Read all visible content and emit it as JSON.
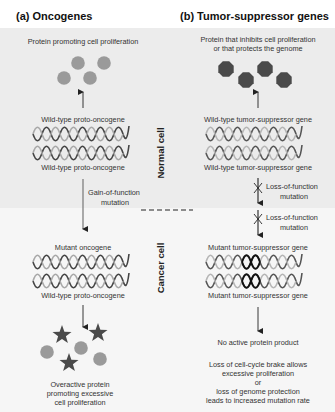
{
  "panel_a": {
    "title": "(a) Oncogenes",
    "protein_label": "Protein promoting cell proliferation",
    "gene_top_label": "Wild-type proto-oncogene",
    "gene_bottom_label": "Wild-type proto-oncogene",
    "mutation_label_1": "Gain-of-function",
    "mutation_label_2": "mutation",
    "mutant_top_label": "Mutant oncogene",
    "mutant_bottom_label": "Wild-type proto-oncogene",
    "result_line_1": "Overactive protein",
    "result_line_2": "promoting excessive",
    "result_line_3": "cell proliferation"
  },
  "panel_b": {
    "title": "(b) Tumor-suppressor genes",
    "protein_label_1": "Protein that inhibits cell proliferation",
    "protein_label_2": "or that protects the genome",
    "gene_top_label": "Wild-type tumor-suppressor gene",
    "gene_bottom_label": "Wild-type tumor-suppressor gene",
    "mutation_1_line_1": "Loss-of-function",
    "mutation_1_line_2": "mutation",
    "mutation_2_line_1": "Loss-of-function",
    "mutation_2_line_2": "mutation",
    "mutant_top_label": "Mutant tumor-suppressor gene",
    "mutant_bottom_label": "Mutant tumor-suppressor gene",
    "no_product": "No active protein product",
    "result_line_1": "Loss of cell-cycle brake allows",
    "result_line_2": "excessive proliferation",
    "result_line_3": "or",
    "result_line_4": "loss of genome protection",
    "result_line_5": "leads to increased mutation rate"
  },
  "side_labels": {
    "normal": "Normal cell",
    "cancer": "Cancer cell"
  },
  "colors": {
    "panel_bg": "#ececec",
    "lower_bg": "#f6f6f6",
    "oncogene_protein": "#9a9a9a",
    "suppressor_protein": "#4a4a4a",
    "star": "#4a4a4a",
    "helix_dark": "#555555",
    "helix_light": "#b5b5b5"
  }
}
